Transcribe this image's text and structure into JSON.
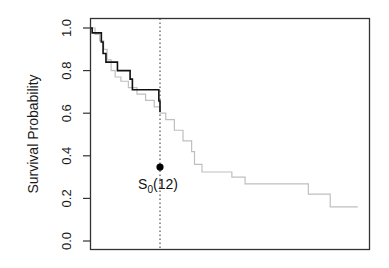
{
  "chart_data": {
    "type": "line",
    "title": "",
    "xlabel": "",
    "ylabel": "Survival Probability",
    "ylim": [
      0,
      1
    ],
    "xlim": [
      0,
      48
    ],
    "x_ticks_shown": false,
    "y_ticks": [
      "0.0",
      "0.2",
      "0.4",
      "0.6",
      "0.8",
      "1.0"
    ],
    "grid": false,
    "legend": null,
    "series": [
      {
        "name": "reference-step-curve",
        "style": "step",
        "color": "#bfbfbf",
        "x": [
          0,
          0.7,
          1.5,
          2.2,
          2.8,
          3.5,
          4.2,
          5.2,
          6.5,
          8,
          9.5,
          11,
          12,
          13,
          14.5,
          16,
          17.5,
          18,
          19.3,
          24.5,
          26.8,
          37.8,
          41.6,
          46.4
        ],
        "y": [
          1.0,
          0.97,
          0.94,
          0.9,
          0.85,
          0.8,
          0.77,
          0.75,
          0.72,
          0.69,
          0.66,
          0.63,
          0.6,
          0.57,
          0.52,
          0.47,
          0.42,
          0.36,
          0.324,
          0.3,
          0.268,
          0.22,
          0.16,
          0.16
        ]
      },
      {
        "name": "observed-step-curve",
        "style": "step",
        "color": "#111111",
        "x": [
          0,
          0.2,
          1.8,
          2.1,
          2.6,
          4.6,
          6.8,
          7.2,
          11.8,
          12
        ],
        "y": [
          1.0,
          0.977,
          0.934,
          0.88,
          0.84,
          0.8,
          0.76,
          0.71,
          0.657,
          0.606
        ]
      }
    ],
    "vline": {
      "x": 12,
      "style": "dotted",
      "color": "#333333"
    },
    "points": [
      {
        "x": 12,
        "y": 0.347,
        "label": "S0(12)"
      }
    ]
  },
  "annotation": {
    "main": "S",
    "sub": "0",
    "rest": "(12)"
  }
}
